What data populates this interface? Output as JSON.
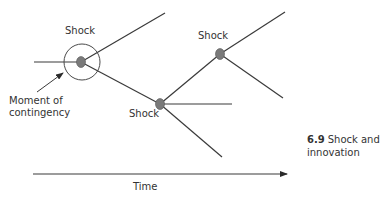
{
  "diagram": {
    "title": "Shock and innovation",
    "figure_number": "6.9",
    "caption_rest": "Shock and",
    "caption_line2": "innovation",
    "labels": {
      "shock_1": "Shock",
      "shock_2": "Shock",
      "shock_3": "Shock",
      "moment_line1": "Moment of",
      "moment_line2": "contingency",
      "time_axis": "Time"
    },
    "nodes": [
      {
        "id": "shock-1",
        "x": 81,
        "y": 62,
        "circled": true
      },
      {
        "id": "shock-2",
        "x": 160,
        "y": 104,
        "circled": false
      },
      {
        "id": "shock-3",
        "x": 220,
        "y": 54,
        "circled": false
      }
    ],
    "edges": [
      {
        "from": [
          34,
          62
        ],
        "to": [
          81,
          62
        ]
      },
      {
        "from": [
          81,
          62
        ],
        "to": [
          165,
          13
        ]
      },
      {
        "from": [
          81,
          62
        ],
        "to": [
          160,
          104
        ]
      },
      {
        "from": [
          160,
          104
        ],
        "to": [
          220,
          54
        ]
      },
      {
        "from": [
          160,
          104
        ],
        "to": [
          232,
          104
        ]
      },
      {
        "from": [
          160,
          104
        ],
        "to": [
          222,
          157
        ]
      },
      {
        "from": [
          220,
          54
        ],
        "to": [
          285,
          12
        ]
      },
      {
        "from": [
          220,
          54
        ],
        "to": [
          283,
          98
        ]
      }
    ],
    "colors": {
      "line": "#3a3a3a",
      "node_fill": "#7a7a7a",
      "text": "#333333"
    }
  }
}
